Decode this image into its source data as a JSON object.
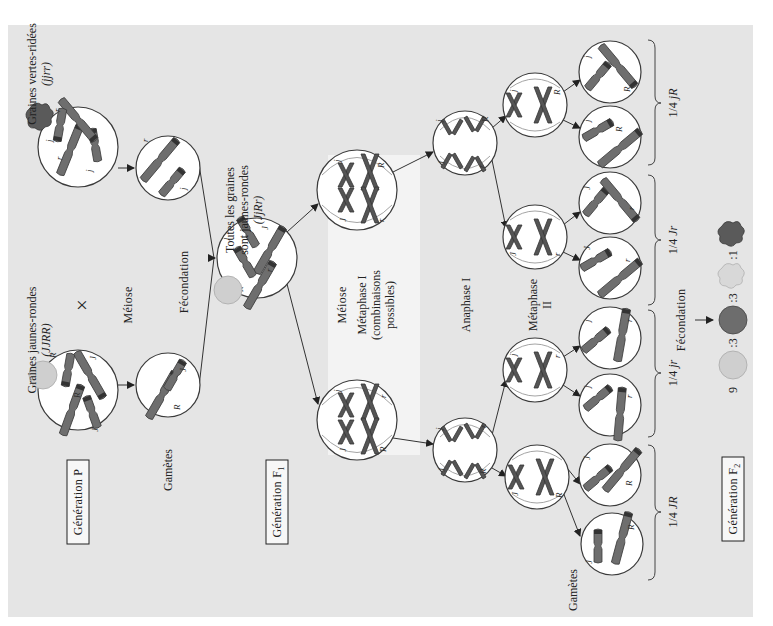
{
  "orientation": "rotated-90-ccw",
  "generations": {
    "p": "Génération P",
    "f1": "Génération F",
    "f1_sub": "1",
    "f2": "Génération F",
    "f2_sub": "2"
  },
  "parents": {
    "yellow_round": {
      "label": "Graines jaunes-rondes",
      "genotype": "(JJRR)"
    },
    "green_wrinkled": {
      "label": "Graines vertes-ridées",
      "genotype": "(jjrr)"
    },
    "cross_symbol": "×"
  },
  "steps": {
    "meiosis_p": "Méiose",
    "fecondation_1": "Fécondation",
    "gametes_p": "Gamètes",
    "meiosis_f1": "Méiose",
    "metaphase1": "Métaphase I",
    "metaphase1_note_1": "(combinaisons",
    "metaphase1_note_2": "possibles)",
    "anaphase1": "Anaphase I",
    "metaphase2_1": "Métaphase",
    "metaphase2_2": "II",
    "gametes_f1": "Gamètes",
    "fecondation_2": "Fécondation"
  },
  "f1": {
    "line1": "Toutes les graines",
    "line2": "sont jaunes-rondes",
    "genotype": "(JjRr)"
  },
  "gamete_groups": [
    {
      "fraction": "1/4",
      "genotype": "jR"
    },
    {
      "fraction": "1/4",
      "genotype": "Jr"
    },
    {
      "fraction": "1/4",
      "genotype": "jr"
    },
    {
      "fraction": "1/4",
      "genotype": "JR"
    }
  ],
  "f2_ratio": {
    "items": [
      {
        "count": "9",
        "phenotype": "jaunes-rondes"
      },
      {
        "count": ":3",
        "phenotype": "vertes-rondes"
      },
      {
        "count": ":3",
        "phenotype": "jaunes-ridées"
      },
      {
        "count": ":1",
        "phenotype": "vertes-ridées"
      }
    ]
  },
  "alleles": {
    "J": "J",
    "j": "j",
    "R": "R",
    "r": "r"
  },
  "colors": {
    "panel": "#e5e5e5",
    "meiosis_box": "#f3f3f3",
    "cell_fill": "#ffffff",
    "chromosome": "#6e6e6e"
  }
}
